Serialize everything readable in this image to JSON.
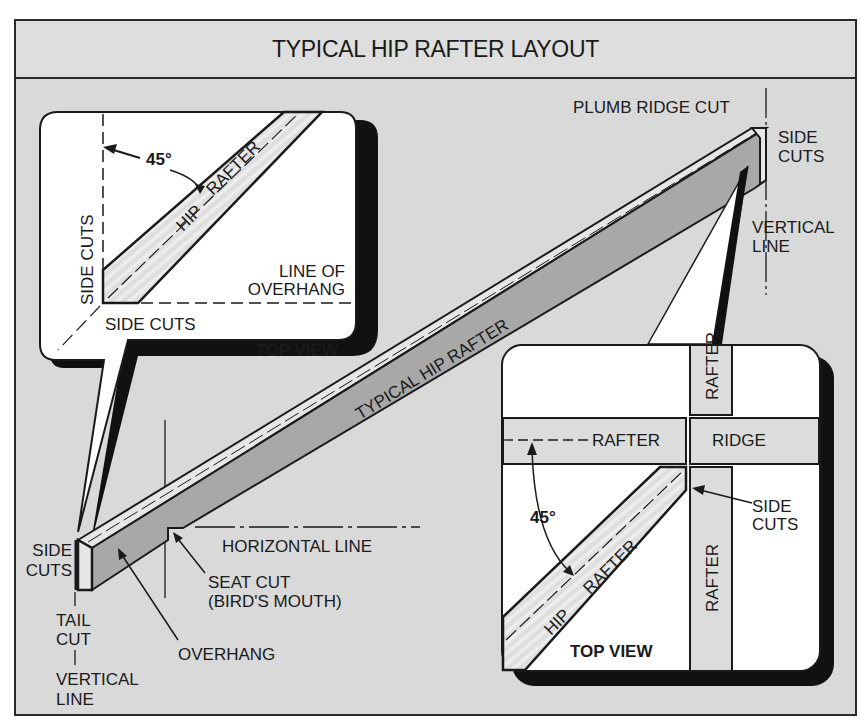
{
  "title": "TYPICAL HIP RAFTER LAYOUT",
  "colors": {
    "background": "#d9d9d9",
    "header": "#dedede",
    "rafter_face": "#a8a8a8",
    "rafter_top": "#e6e6e6",
    "panel": "#ffffff",
    "ink": "#1a1a1a"
  },
  "main_rafter": {
    "label": "TYPICAL HIP RAFTER",
    "callouts": {
      "plumb_ridge_cut": "PLUMB RIDGE CUT",
      "side_cuts_top_1": "SIDE",
      "side_cuts_top_2": "CUTS",
      "vertical_line_top_1": "VERTICAL",
      "vertical_line_top_2": "LINE",
      "side_cuts_tail_1": "SIDE",
      "side_cuts_tail_2": "CUTS",
      "tail_cut_1": "TAIL",
      "tail_cut_2": "CUT",
      "vertical_line_bottom_1": "VERTICAL",
      "vertical_line_bottom_2": "LINE",
      "overhang": "OVERHANG",
      "horizontal_line": "HORIZONTAL LINE",
      "seat_cut_1": "SEAT CUT",
      "seat_cut_2": "(BIRD'S MOUTH)"
    }
  },
  "inset_tail": {
    "title": "TOP VIEW",
    "angle": "45°",
    "hip": "HIP",
    "rafter": "RAFTER",
    "side_cuts_vertical": "SIDE CUTS",
    "side_cuts_bottom": "SIDE CUTS",
    "line_of_overhang_1": "LINE OF",
    "line_of_overhang_2": "OVERHANG"
  },
  "inset_ridge": {
    "title": "TOP VIEW",
    "angle": "45°",
    "hip": "HIP",
    "rafter": "RAFTER",
    "rafter_left": "RAFTER",
    "ridge": "RIDGE",
    "rafter_top": "RAFTER",
    "rafter_bottom": "RAFTER",
    "side_cuts_1": "SIDE",
    "side_cuts_2": "CUTS"
  }
}
